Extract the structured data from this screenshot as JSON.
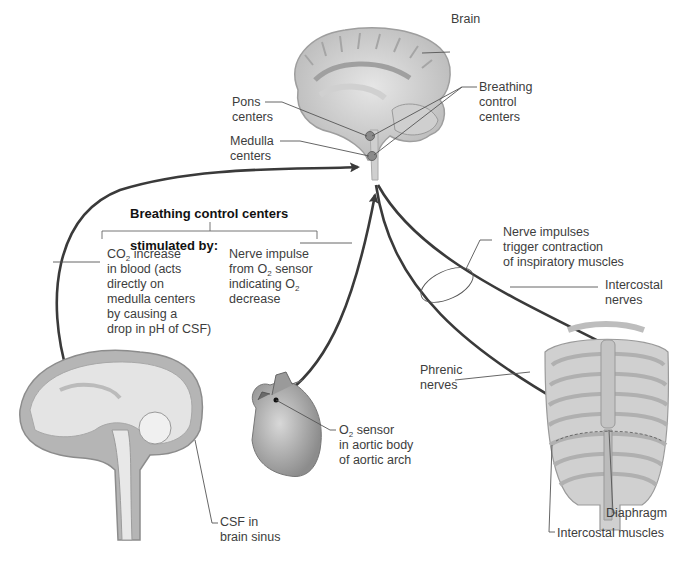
{
  "diagram": {
    "title": "Breathing control centers stimulated by:",
    "labels": {
      "brain": "Brain",
      "breathing_control_centers": "Breathing\ncontrol\ncenters",
      "pons_centers": "Pons\ncenters",
      "medulla_centers": "Medulla\ncenters",
      "heading_line1": "Breathing control centers",
      "heading_line2": "stimulated by:",
      "co2_stimulus": {
        "prefix": "CO",
        "sub": "2",
        "rest": " increase\nin blood (acts\ndirectly on\nmedulla centers\nby causing a\ndrop in pH of CSF)"
      },
      "o2_stimulus": {
        "line1": "Nerve impulse",
        "line2_prefix": "from O",
        "line2_sub": "2",
        "line2_rest": " sensor",
        "line3_prefix": "indicating O",
        "line3_sub": "2",
        "line4": "decrease"
      },
      "nerve_impulses": "Nerve impulses\ntrigger contraction\nof inspiratory muscles",
      "intercostal_nerves": "Intercostal\nnerves",
      "phrenic_nerves": "Phrenic\nnerves",
      "o2_sensor": {
        "prefix": "O",
        "sub": "2",
        "rest": " sensor\nin aortic body\nof aortic arch"
      },
      "csf": "CSF in\nbrain sinus",
      "diaphragm": "Diaphragm",
      "intercostal_muscles": "Intercostal muscles"
    },
    "illustrations": [
      "brain-sagittal-top",
      "brain-sagittal-csf",
      "heart",
      "rib-cage"
    ],
    "colors": {
      "arrow": "#3a3a3a",
      "leader": "#555555",
      "tissue": "#c9c9c9",
      "tissue_dark": "#9a9a9a",
      "background": "#ffffff"
    }
  }
}
